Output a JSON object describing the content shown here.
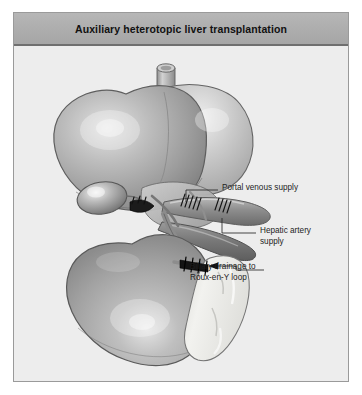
{
  "figure": {
    "title": "Auxiliary heterotopic liver transplantation",
    "background_color": "#ededed",
    "title_bar_color": "#adadad",
    "border_color": "#9a9a9a",
    "page_color": "#ffffff"
  },
  "callouts": [
    {
      "id": "portal-venous-supply",
      "lines": [
        "Portal venous supply"
      ],
      "leader": "horizontal line from vessel to text"
    },
    {
      "id": "hepatic-artery-supply",
      "lines": [
        "Hepatic artery",
        "supply"
      ],
      "leader": "horizontal line from vessel to text"
    },
    {
      "id": "biliary-drainage",
      "lines": [
        "Biliary drainage to",
        "Roux-en-Y loop"
      ],
      "leader": "line with left-pointing arrowhead to anastomosis"
    }
  ],
  "illustration": {
    "style": "grayscale medical line drawing with airbrush shading",
    "structures": [
      {
        "name": "native-liver",
        "note": "large upper liver, right and left lobes"
      },
      {
        "name": "vena-cava-stump",
        "note": "vertical cylindrical vessel at top of native liver"
      },
      {
        "name": "gallbladder",
        "note": "oval body beneath native liver edge"
      },
      {
        "name": "auxiliary-liver-graft",
        "note": "lower transplanted liver lobe"
      },
      {
        "name": "portal-vein",
        "note": "broad vessel with sutured anastomosis"
      },
      {
        "name": "hepatic-artery",
        "note": "darker vessel running to graft hilum"
      },
      {
        "name": "roux-en-y-loop",
        "note": "pale curved bowel loop, right of graft"
      },
      {
        "name": "bile-duct-anastomosis",
        "note": "dark sutured junction to bowel loop"
      }
    ],
    "palette": {
      "organ_mid": "#a8a8a8",
      "organ_light": "#d8d8d8",
      "organ_dark": "#7d7d7d",
      "vessel_dark": "#6e6e6e",
      "bowel_pale": "#e6e6e2",
      "outline": "#5a5a5a",
      "suture": "#1a1a1a"
    }
  }
}
